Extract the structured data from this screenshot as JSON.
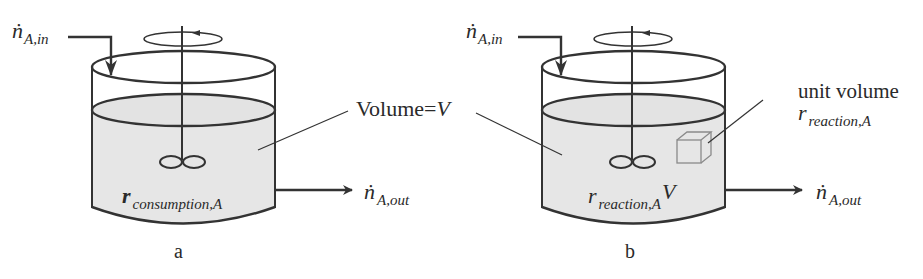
{
  "figure": {
    "panels": [
      {
        "id": "a",
        "caption": "a",
        "inflow_label": {
          "symbol": "ṅ",
          "subscript": "A,in"
        },
        "outflow_label": {
          "symbol": "ṅ",
          "subscript": "A,out"
        },
        "rate_label": {
          "symbol": "r",
          "subscript": "consumption,A"
        }
      },
      {
        "id": "b",
        "caption": "b",
        "inflow_label": {
          "symbol": "ṅ",
          "subscript": "A,in"
        },
        "outflow_label": {
          "symbol": "ṅ",
          "subscript": "A,out"
        },
        "rate_label": {
          "symbol": "r",
          "subscript": "reaction,A",
          "suffix": "V"
        },
        "unit_volume_label": "unit volume",
        "unit_volume_rate": {
          "symbol": "r",
          "subscript": "reaction,A"
        }
      }
    ],
    "shared_label": {
      "text": "Volume=",
      "var": "V"
    },
    "colors": {
      "stroke": "#333333",
      "liquid": "#e6e6e6",
      "cube": "#8a8a8a"
    }
  }
}
